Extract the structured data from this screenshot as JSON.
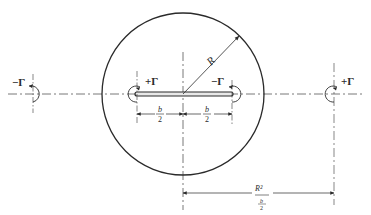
{
  "figure": {
    "circle": {
      "cx": 183,
      "cy": 94,
      "r": 80,
      "stroke": "#2a2a2a"
    },
    "plate": {
      "x1": 135,
      "x2": 232,
      "y": 94
    },
    "labels": {
      "radius": "R",
      "half_span_left_num": "b",
      "half_span_left_den": "2",
      "half_span_right_num": "b",
      "half_span_right_den": "2",
      "image_distance_num": "R²",
      "image_distance_den_num": "b",
      "image_distance_den_den": "2"
    },
    "vortices": [
      {
        "id": "far-left",
        "label": "−Γ",
        "x": 33,
        "y": 94
      },
      {
        "id": "plate-left",
        "label": "+Γ",
        "x": 137,
        "y": 94
      },
      {
        "id": "plate-right",
        "label": "−Γ",
        "x": 232,
        "y": 94
      },
      {
        "id": "far-right",
        "label": "+Γ",
        "x": 334,
        "y": 94
      }
    ]
  }
}
